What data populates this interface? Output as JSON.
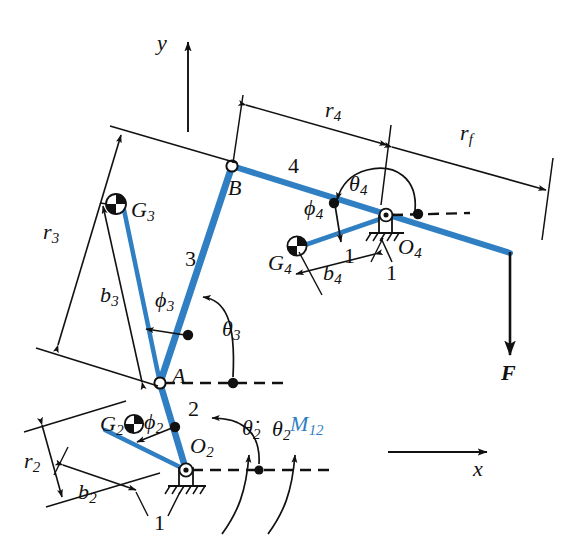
{
  "figure": {
    "background_color": "#ffffff",
    "link_color": "#2f7fc2",
    "line_color": "#111111",
    "moment_label_color": "#2f7fc2"
  },
  "axes": {
    "y_label": "y",
    "x_label": "x"
  },
  "joints": [
    {
      "name": "A",
      "label": "A",
      "x": 160,
      "y": 383,
      "type": "pin-open"
    },
    {
      "name": "B",
      "label": "B",
      "x": 232,
      "y": 166,
      "type": "pin-open"
    },
    {
      "name": "O2",
      "label": "O",
      "sub": "2",
      "x": 186,
      "y": 470,
      "type": "ground-pivot"
    },
    {
      "name": "O4",
      "label": "O",
      "sub": "4",
      "x": 386,
      "y": 217,
      "type": "ground-pivot"
    }
  ],
  "links": [
    {
      "number": "2",
      "label": "2",
      "from": "O2",
      "to": "A"
    },
    {
      "number": "3",
      "label": "3",
      "from": "A",
      "to": "B"
    },
    {
      "number": "4",
      "label": "4",
      "from": "B",
      "to": "O4"
    }
  ],
  "ground_labels": [
    {
      "label": "1",
      "x": 159,
      "y": 487
    },
    {
      "label": "1",
      "x": 348,
      "y": 258
    },
    {
      "label": "1",
      "x": 388,
      "y": 265
    }
  ],
  "mass_centers": [
    {
      "label": "G",
      "sub": "2",
      "x": 110,
      "y": 424
    },
    {
      "label": "G",
      "sub": "3",
      "x": 131,
      "y": 210
    },
    {
      "label": "G",
      "sub": "4",
      "x": 295,
      "y": 244
    }
  ],
  "dimensions": [
    {
      "label": "r",
      "sub": "2",
      "desc": "link 2 length"
    },
    {
      "label": "r",
      "sub": "3",
      "desc": "link 3 length"
    },
    {
      "label": "r",
      "sub": "4",
      "desc": "link 4 length"
    },
    {
      "label": "r",
      "sub": "f",
      "desc": "force offset distance"
    },
    {
      "label": "b",
      "sub": "2",
      "desc": "link 2 cg offset"
    },
    {
      "label": "b",
      "sub": "3",
      "desc": "link 3 cg offset"
    },
    {
      "label": "b",
      "sub": "4",
      "desc": "link 4 cg offset"
    }
  ],
  "angles": [
    {
      "label": "θ",
      "sub": "2",
      "desc": "link 2 angle"
    },
    {
      "label": "θ",
      "sub": "3",
      "desc": "link 3 angle"
    },
    {
      "label": "θ",
      "sub": "4",
      "desc": "link 4 angle"
    },
    {
      "label": "ϕ",
      "sub": "2",
      "desc": "link 2 cg angle"
    },
    {
      "label": "ϕ",
      "sub": "3",
      "desc": "link 3 cg angle"
    },
    {
      "label": "ϕ",
      "sub": "4",
      "desc": "link 4 cg angle"
    }
  ],
  "kinematics": {
    "omega_label": "θ̇",
    "omega_sub": "2",
    "moment_label": "M",
    "moment_sub": "12"
  },
  "force": {
    "label": "F",
    "description": "external downward force at end of link 4"
  },
  "text_labels": {
    "y": "y",
    "x": "x",
    "A": "A",
    "B": "B",
    "O": "O",
    "G": "G",
    "r": "r",
    "b": "b",
    "theta": "θ",
    "thetadot": "θ̇",
    "phi": "ϕ",
    "M": "M",
    "F": "F",
    "one": "1",
    "two": "2",
    "three": "3",
    "four": "4",
    "sub_2": "2",
    "sub_3": "3",
    "sub_4": "4",
    "sub_f": "f",
    "sub_12": "12"
  }
}
